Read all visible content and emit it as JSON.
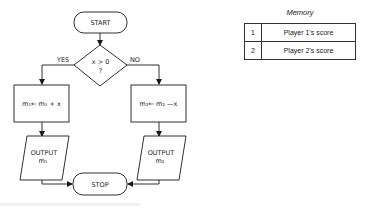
{
  "flowchart": {
    "start_label": "START",
    "decision": {
      "line1": "x > 0",
      "line2": "?"
    },
    "yes_label": "YES",
    "no_label": "NO",
    "process_left": "m₁← m₁ + x",
    "process_right": "m₂← m₂ —x",
    "output_left": {
      "line1": "OUTPUT",
      "line2": "m₁"
    },
    "output_right": {
      "line1": "OUTPUT",
      "line2": "m₂"
    },
    "stop_label": "STOP"
  },
  "memory": {
    "title": "Memory",
    "rows": [
      {
        "index": "1",
        "value": "Player 1's score"
      },
      {
        "index": "2",
        "value": "Player 2's score"
      }
    ]
  }
}
